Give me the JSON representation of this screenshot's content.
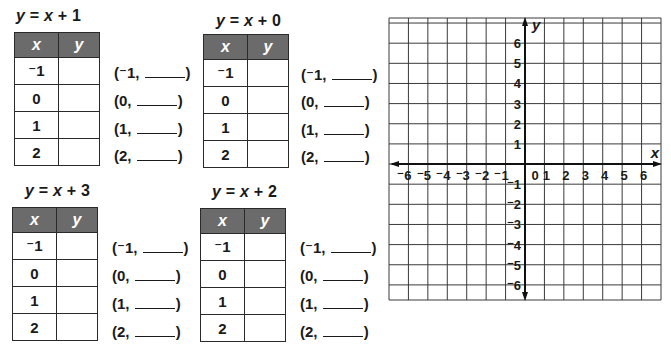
{
  "worksheet": {
    "tables": [
      {
        "id": "t1",
        "equation": {
          "prefix": "y",
          "equals": " = ",
          "var": "x",
          "rest": " + 1"
        },
        "headers": {
          "x": "x",
          "y": "y"
        },
        "rows": [
          {
            "x": "⁻1",
            "y": "",
            "pair_open": "(⁻1, ",
            "pair_close": ")"
          },
          {
            "x": "0",
            "y": "",
            "pair_open": "(0, ",
            "pair_close": ")"
          },
          {
            "x": "1",
            "y": "",
            "pair_open": "(1, ",
            "pair_close": ")"
          },
          {
            "x": "2",
            "y": "",
            "pair_open": "(2, ",
            "pair_close": ")"
          }
        ]
      },
      {
        "id": "t2",
        "equation": {
          "prefix": "y",
          "equals": " = ",
          "var": "x",
          "rest": " + 0"
        },
        "headers": {
          "x": "x",
          "y": "y"
        },
        "rows": [
          {
            "x": "⁻1",
            "y": "",
            "pair_open": "(⁻1, ",
            "pair_close": ")"
          },
          {
            "x": "0",
            "y": "",
            "pair_open": "(0, ",
            "pair_close": ")"
          },
          {
            "x": "1",
            "y": "",
            "pair_open": "(1, ",
            "pair_close": ")"
          },
          {
            "x": "2",
            "y": "",
            "pair_open": "(2, ",
            "pair_close": ")"
          }
        ]
      },
      {
        "id": "t3",
        "equation": {
          "prefix": "y",
          "equals": " = ",
          "var": "x",
          "rest": " + 3"
        },
        "headers": {
          "x": "x",
          "y": "y"
        },
        "rows": [
          {
            "x": "⁻1",
            "y": "",
            "pair_open": "(⁻1, ",
            "pair_close": ")"
          },
          {
            "x": "0",
            "y": "",
            "pair_open": "(0, ",
            "pair_close": ")"
          },
          {
            "x": "1",
            "y": "",
            "pair_open": "(1, ",
            "pair_close": ")"
          },
          {
            "x": "2",
            "y": "",
            "pair_open": "(2, ",
            "pair_close": ")"
          }
        ]
      },
      {
        "id": "t4",
        "equation": {
          "prefix": "y",
          "equals": " = ",
          "var": "x",
          "rest": " + 2"
        },
        "headers": {
          "x": "x",
          "y": "y"
        },
        "rows": [
          {
            "x": "⁻1",
            "y": "",
            "pair_open": "(⁻1, ",
            "pair_close": ")"
          },
          {
            "x": "0",
            "y": "",
            "pair_open": "(0, ",
            "pair_close": ")"
          },
          {
            "x": "1",
            "y": "",
            "pair_open": "(1, ",
            "pair_close": ")"
          },
          {
            "x": "2",
            "y": "",
            "pair_open": "(2, ",
            "pair_close": ")"
          }
        ]
      }
    ],
    "grid": {
      "x_axis_label": "x",
      "y_axis_label": "y",
      "x_ticks": [
        "⁻6",
        "⁻5",
        "⁻4",
        "⁻3",
        "⁻2",
        "⁻1",
        "0",
        "1",
        "2",
        "3",
        "4",
        "5",
        "6"
      ],
      "y_ticks_positive": [
        "6",
        "5",
        "4",
        "3",
        "2",
        "1"
      ],
      "y_ticks_negative": [
        "⁻1",
        "⁻2",
        "⁻3",
        "⁻4",
        "⁻5",
        "⁻6"
      ],
      "range": {
        "xmin": -6,
        "xmax": 6,
        "ymin": -6,
        "ymax": 6
      }
    },
    "colors": {
      "header_bg": "#6b6b6b",
      "header_text": "#ffffff",
      "line": "#2a2a2a",
      "grid_line": "#3a3a3a"
    }
  }
}
